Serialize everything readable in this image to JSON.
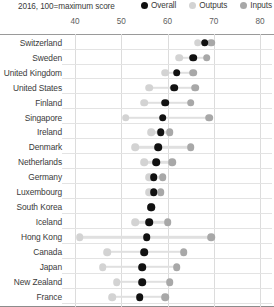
{
  "header": {
    "subtitle": "2016, 100=maximum score"
  },
  "legend": {
    "position": "top-right",
    "items": [
      {
        "label": "Overall",
        "color": "#111111",
        "icon": "circle-marker-icon"
      },
      {
        "label": "Outputs",
        "color": "#d3d3d3",
        "icon": "circle-marker-icon"
      },
      {
        "label": "Inputs",
        "color": "#a8a8a8",
        "icon": "circle-marker-icon"
      }
    ]
  },
  "axis": {
    "ticks": [
      "40",
      "50",
      "60",
      "70",
      "80"
    ],
    "min": 36,
    "max": 82
  },
  "chart_data": {
    "type": "scatter",
    "title": "",
    "subtitle": "2016, 100=maximum score",
    "xlabel": "",
    "ylabel": "",
    "xlim": [
      36,
      82
    ],
    "grid": true,
    "legend_position": "top-right",
    "tick_labels": [
      40,
      50,
      60,
      70,
      80
    ],
    "categories": [
      "Switzerland",
      "Sweden",
      "United Kingdom",
      "United States",
      "Finland",
      "Singapore",
      "Ireland",
      "Denmark",
      "Netherlands",
      "Germany",
      "Luxembourg",
      "South Korea",
      "Iceland",
      "Hong Kong",
      "Canada",
      "Japan",
      "New Zealand",
      "France"
    ],
    "series": [
      {
        "name": "Overall",
        "color": "#111111",
        "values": [
          68.0,
          65.5,
          62.0,
          61.5,
          59.5,
          59.0,
          58.5,
          58.0,
          57.5,
          57.0,
          57.0,
          56.5,
          56.0,
          55.5,
          55.0,
          54.5,
          54.5,
          54.0
        ]
      },
      {
        "name": "Outputs",
        "color": "#d3d3d3",
        "values": [
          66.5,
          62.5,
          59.5,
          56.0,
          55.0,
          51.0,
          56.5,
          53.0,
          55.0,
          56.0,
          56.0,
          56.5,
          53.0,
          41.0,
          47.0,
          46.0,
          49.0,
          48.0
        ]
      },
      {
        "name": "Inputs",
        "color": "#a8a8a8",
        "values": [
          69.5,
          68.5,
          65.5,
          66.0,
          65.0,
          69.0,
          60.5,
          65.0,
          61.0,
          59.0,
          58.5,
          56.5,
          60.0,
          69.5,
          63.5,
          62.0,
          60.5,
          59.5
        ]
      }
    ]
  }
}
